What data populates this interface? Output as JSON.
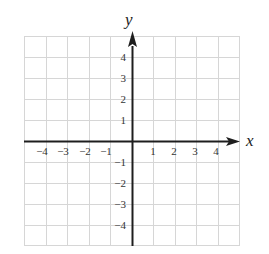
{
  "diagram": {
    "type": "coordinate-plane",
    "x_axis_label": "x",
    "y_axis_label": "y",
    "x_range": [
      -5,
      5
    ],
    "y_range": [
      -5,
      5
    ],
    "grid_step": 1,
    "x_tick_labels": [
      "-4",
      "-3",
      "-2",
      "-1",
      "1",
      "2",
      "3",
      "4"
    ],
    "y_tick_labels": [
      "4",
      "3",
      "2",
      "1",
      "-1",
      "-2",
      "-3",
      "-4"
    ],
    "colors": {
      "grid": "#d6d6d6",
      "axis": "#1e1e1e",
      "label": "#333333",
      "background": "#ffffff"
    }
  },
  "labels": {
    "x": {
      "m4": "−4",
      "m3": "−3",
      "m2": "−2",
      "m1": "−1",
      "p1": "1",
      "p2": "2",
      "p3": "3",
      "p4": "4"
    },
    "y": {
      "p4": "4",
      "p3": "3",
      "p2": "2",
      "p1": "1",
      "m1": "−1",
      "m2": "−2",
      "m3": "−3",
      "m4": "−4"
    }
  }
}
